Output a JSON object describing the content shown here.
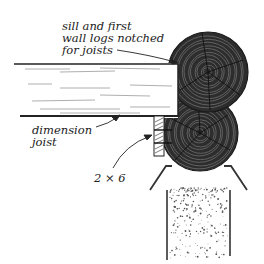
{
  "diagram": {
    "labels": {
      "sill_logs": [
        "sill and first",
        "wall logs notched",
        "for joists"
      ],
      "dimension_joist": [
        "dimension",
        "joist"
      ],
      "lumber_size": "2 × 6"
    },
    "components": [
      {
        "id": "upper-log",
        "description": "first wall log, end grain"
      },
      {
        "id": "lower-log",
        "description": "sill log, end grain"
      },
      {
        "id": "joist",
        "description": "dimension joist, side view"
      },
      {
        "id": "spacer-blocks",
        "description": "2 × 6 blocking"
      },
      {
        "id": "foundation",
        "description": "concrete foundation wall"
      },
      {
        "id": "flashing",
        "description": "sheet metal termite shield"
      }
    ],
    "colors": {
      "log": "#2d2d2d",
      "ring": "#6a6a6a",
      "ink": "#1a1a1a",
      "paper": "#ffffff"
    }
  }
}
